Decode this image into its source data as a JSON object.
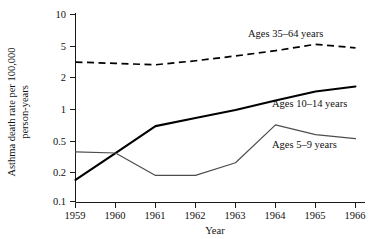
{
  "chart_data": {
    "type": "line",
    "title": "",
    "xlabel": "Year",
    "ylabel": "Asthma death rate per 100,000 person-years",
    "ylabel_line1": "Asthma death rate per 100,000",
    "ylabel_line2": "person-years",
    "x": [
      1959,
      1960,
      1961,
      1962,
      1963,
      1964,
      1965,
      1966
    ],
    "xtick_labels": [
      "1959",
      "1960",
      "1961",
      "1962",
      "1963",
      "1964",
      "1965",
      "1966"
    ],
    "ytick_labels": [
      "10",
      "5",
      "2",
      "1",
      "0.5",
      "0.2",
      "0.1"
    ],
    "ytick_values": [
      10,
      5,
      2,
      1,
      0.5,
      0.2,
      0.1
    ],
    "ylim": [
      0.1,
      10
    ],
    "yscale": "log",
    "xlim": [
      1959,
      1966
    ],
    "grid": false,
    "legend_position": "inline-annotations",
    "series": [
      {
        "name": "Ages 35–64 years",
        "label": "Ages 35–64 years",
        "style": "dashed",
        "color": "#000000",
        "values": [
          3.1,
          3.0,
          2.9,
          3.2,
          3.6,
          4.1,
          4.8,
          4.4
        ]
      },
      {
        "name": "Ages 10–14 years",
        "label": "Ages 10–14 years",
        "style": "solid-thick",
        "color": "#000000",
        "values": [
          0.17,
          0.33,
          0.64,
          0.78,
          0.95,
          1.2,
          1.5,
          1.7
        ]
      },
      {
        "name": "Ages 5–9 years",
        "label": "Ages 5–9 years",
        "style": "solid-thin",
        "color": "#4d4d4d",
        "values": [
          0.34,
          0.33,
          0.19,
          0.19,
          0.26,
          0.66,
          0.52,
          0.47
        ]
      }
    ]
  },
  "annotations": {
    "label_35_64": "Ages 35–64 years",
    "label_10_14": "Ages 10–14 years",
    "label_5_9": "Ages 5–9 years"
  },
  "axes": {
    "x_title": "Year",
    "y_title_line1": "Asthma death rate per 100,000",
    "y_title_line2": "person-years",
    "xticks": [
      "1959",
      "1960",
      "1961",
      "1962",
      "1963",
      "1964",
      "1965",
      "1966"
    ],
    "yticks": [
      "10",
      "5",
      "2",
      "1",
      "0.5",
      "0.2",
      "0.1"
    ]
  }
}
